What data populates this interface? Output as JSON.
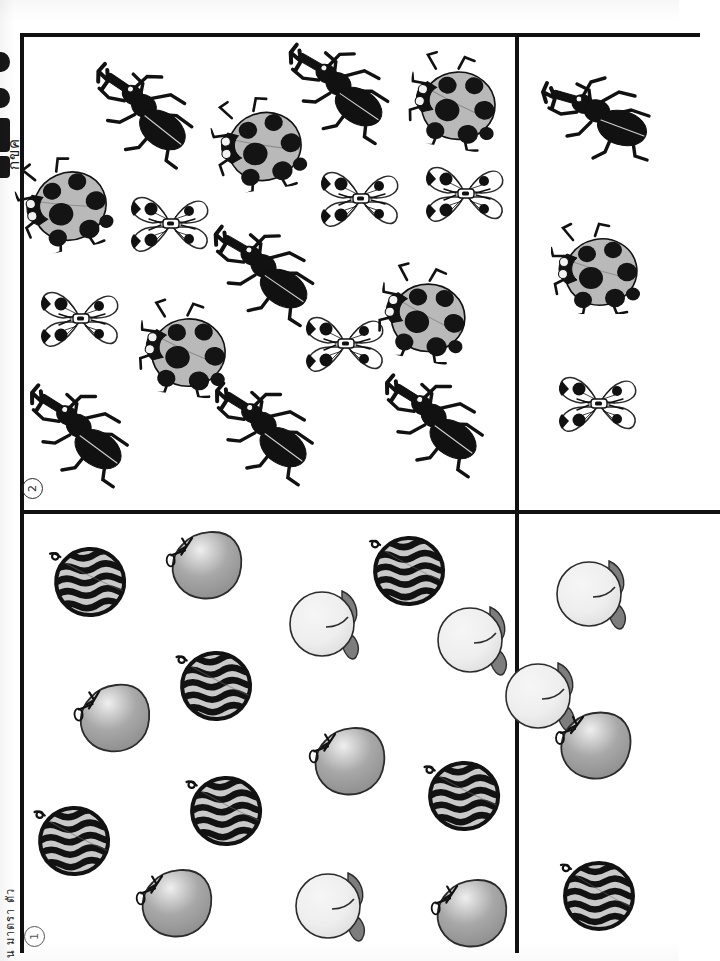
{
  "document": {
    "kind": "scanned-counting-worksheet",
    "orientation": "rotated-90",
    "page_background": "#ffffff",
    "ink_color": "#111111"
  },
  "spine": {
    "bleed_text_top": "กขค",
    "bleed_text_bottom": "น มาตรา ตัว",
    "blob_count": 4
  },
  "markers": [
    {
      "id": "marker-1",
      "label": "1",
      "section": "fruits"
    },
    {
      "id": "marker-2",
      "label": "2",
      "section": "insects"
    }
  ],
  "panels": {
    "insects_field": {
      "name": "Insects counting field",
      "index_label": "2",
      "counts": {
        "beetle": 6,
        "ladybug": 5,
        "butterfly": 5,
        "total": 16
      },
      "items": [
        {
          "type": "beetle",
          "x": 60,
          "y": 30,
          "rot": 18,
          "scale": 1.0
        },
        {
          "type": "ladybug",
          "x": 190,
          "y": 60,
          "rot": -8,
          "scale": 1.02
        },
        {
          "type": "beetle",
          "x": 255,
          "y": 8,
          "rot": 14,
          "scale": 1.0
        },
        {
          "type": "ladybug",
          "x": 385,
          "y": 18,
          "rot": 10,
          "scale": 1.02
        },
        {
          "type": "ladybug",
          "x": -5,
          "y": 120,
          "rot": -12,
          "scale": 1.02
        },
        {
          "type": "butterfly",
          "x": 105,
          "y": 150,
          "rot": 0,
          "scale": 1.0
        },
        {
          "type": "butterfly",
          "x": 295,
          "y": 125,
          "rot": 0,
          "scale": 1.0
        },
        {
          "type": "butterfly",
          "x": 400,
          "y": 120,
          "rot": 0,
          "scale": 1.0
        },
        {
          "type": "beetle",
          "x": 180,
          "y": 190,
          "rot": 14,
          "scale": 1.0
        },
        {
          "type": "butterfly",
          "x": 15,
          "y": 245,
          "rot": 0,
          "scale": 1.0
        },
        {
          "type": "ladybug",
          "x": 115,
          "y": 265,
          "rot": 8,
          "scale": 1.02
        },
        {
          "type": "butterfly",
          "x": 280,
          "y": 270,
          "rot": 0,
          "scale": 1.0
        },
        {
          "type": "ladybug",
          "x": 355,
          "y": 230,
          "rot": 12,
          "scale": 1.02
        },
        {
          "type": "beetle",
          "x": -5,
          "y": 350,
          "rot": 16,
          "scale": 1.0
        },
        {
          "type": "beetle",
          "x": 180,
          "y": 348,
          "rot": 16,
          "scale": 1.0
        },
        {
          "type": "beetle",
          "x": 350,
          "y": 340,
          "rot": 16,
          "scale": 1.0
        }
      ]
    },
    "insects_legend": {
      "name": "Insects legend column",
      "items": [
        {
          "type": "beetle",
          "label": "beetle",
          "x": 18,
          "y": 35
        },
        {
          "type": "ladybug",
          "label": "ladybug",
          "x": 30,
          "y": 185
        },
        {
          "type": "butterfly",
          "label": "butterfly",
          "x": 36,
          "y": 330
        }
      ]
    },
    "fruits_field": {
      "name": "Fruits counting field",
      "index_label": "1",
      "counts": {
        "watermelon": 6,
        "apple": 5,
        "mango": 4,
        "total": 15
      },
      "items": [
        {
          "type": "watermelon",
          "x": 26,
          "y": 26,
          "rot": -4,
          "scale": 1.0
        },
        {
          "type": "apple",
          "x": 140,
          "y": 12,
          "rot": -4,
          "scale": 1.0
        },
        {
          "type": "watermelon",
          "x": 345,
          "y": 15,
          "rot": -2,
          "scale": 1.0
        },
        {
          "type": "mango",
          "x": 262,
          "y": 68,
          "rot": 0,
          "scale": 1.0
        },
        {
          "type": "mango",
          "x": 410,
          "y": 84,
          "rot": 0,
          "scale": 1.0
        },
        {
          "type": "watermelon",
          "x": 152,
          "y": 130,
          "rot": -3,
          "scale": 1.0
        },
        {
          "type": "apple",
          "x": 48,
          "y": 165,
          "rot": -6,
          "scale": 1.0
        },
        {
          "type": "watermelon",
          "x": 162,
          "y": 255,
          "rot": -3,
          "scale": 1.0
        },
        {
          "type": "apple",
          "x": 283,
          "y": 208,
          "rot": -4,
          "scale": 1.0
        },
        {
          "type": "watermelon",
          "x": 10,
          "y": 285,
          "rot": -3,
          "scale": 1.0
        },
        {
          "type": "watermelon",
          "x": 400,
          "y": 240,
          "rot": -3,
          "scale": 1.0
        },
        {
          "type": "apple",
          "x": 110,
          "y": 350,
          "rot": -4,
          "scale": 1.0
        },
        {
          "type": "mango",
          "x": 268,
          "y": 350,
          "rot": 0,
          "scale": 1.0
        },
        {
          "type": "apple",
          "x": 405,
          "y": 360,
          "rot": -4,
          "scale": 1.0
        },
        {
          "type": "mango",
          "x": 478,
          "y": 140,
          "rot": 0,
          "scale": 1.0
        }
      ]
    },
    "fruits_legend": {
      "name": "Fruits legend column",
      "items": [
        {
          "type": "mango",
          "label": "mango",
          "x": 32,
          "y": 38
        },
        {
          "type": "apple",
          "label": "apple",
          "x": 32,
          "y": 192
        },
        {
          "type": "watermelon",
          "label": "watermelon",
          "x": 38,
          "y": 340
        }
      ]
    }
  },
  "palette": {
    "ink": "#111111",
    "ladybug_body": "#b9b9b9",
    "ladybug_spot": "#141414",
    "watermelon_flesh": "#c9c9c9",
    "watermelon_stripe": "#121212",
    "apple_light": "#efefef",
    "apple_mid": "#a8a8a8",
    "apple_dark": "#8d8d8d",
    "mango_light": "#eeeeee",
    "mango_leaf": "#7d7d7d",
    "outline": "#2b2b2b"
  }
}
